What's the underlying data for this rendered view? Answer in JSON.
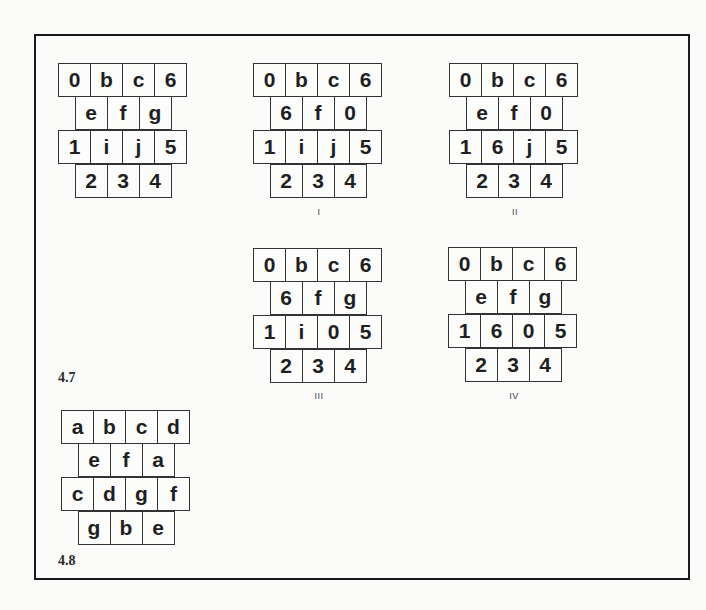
{
  "figures": [
    {
      "id": "4.7",
      "label": "4.7",
      "grids": [
        {
          "name": "original",
          "caption": "",
          "rows": [
            [
              "0",
              "b",
              "c",
              "6"
            ],
            [
              "e",
              "f",
              "g"
            ],
            [
              "1",
              "i",
              "j",
              "5"
            ],
            [
              "2",
              "3",
              "4"
            ]
          ]
        },
        {
          "name": "I",
          "caption": "I",
          "rows": [
            [
              "0",
              "b",
              "c",
              "6"
            ],
            [
              "6",
              "f",
              "0"
            ],
            [
              "1",
              "i",
              "j",
              "5"
            ],
            [
              "2",
              "3",
              "4"
            ]
          ]
        },
        {
          "name": "II",
          "caption": "II",
          "rows": [
            [
              "0",
              "b",
              "c",
              "6"
            ],
            [
              "e",
              "f",
              "0"
            ],
            [
              "1",
              "6",
              "j",
              "5"
            ],
            [
              "2",
              "3",
              "4"
            ]
          ]
        },
        {
          "name": "III",
          "caption": "III",
          "rows": [
            [
              "0",
              "b",
              "c",
              "6"
            ],
            [
              "6",
              "f",
              "g"
            ],
            [
              "1",
              "i",
              "0",
              "5"
            ],
            [
              "2",
              "3",
              "4"
            ]
          ]
        },
        {
          "name": "IV",
          "caption": "IV",
          "rows": [
            [
              "0",
              "b",
              "c",
              "6"
            ],
            [
              "e",
              "f",
              "g"
            ],
            [
              "1",
              "6",
              "0",
              "5"
            ],
            [
              "2",
              "3",
              "4"
            ]
          ]
        }
      ]
    },
    {
      "id": "4.8",
      "label": "4.8",
      "grids": [
        {
          "name": "net",
          "caption": "",
          "rows": [
            [
              "a",
              "b",
              "c",
              "d"
            ],
            [
              "e",
              "f",
              "a"
            ],
            [
              "c",
              "d",
              "g",
              "f"
            ],
            [
              "g",
              "b",
              "e"
            ]
          ]
        }
      ]
    }
  ]
}
